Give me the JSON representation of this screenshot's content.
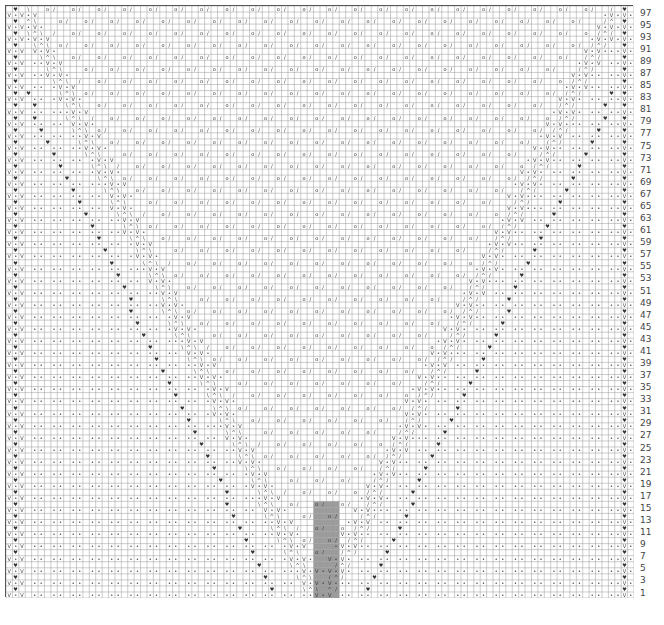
{
  "chart_title": "",
  "chart_type": "knitting-chart",
  "grid": {
    "rows": 98,
    "cols": 98
  },
  "row_labels": [
    "97",
    "95",
    "93",
    "91",
    "89",
    "87",
    "85",
    "83",
    "81",
    "79",
    "77",
    "75",
    "73",
    "71",
    "69",
    "67",
    "65",
    "63",
    "61",
    "59",
    "57",
    "55",
    "53",
    "51",
    "49",
    "47",
    "45",
    "43",
    "41",
    "39",
    "37",
    "35",
    "33",
    "31",
    "29",
    "27",
    "25",
    "23",
    "21",
    "19",
    "17",
    "15",
    "13",
    "11",
    "9",
    "7",
    "5",
    "3",
    "1"
  ],
  "symbols": {
    "slip": "V",
    "purl": "•",
    "slip_wyif": "♥",
    "yarn_over": "o",
    "k2tog": "/",
    "ssk": "\\",
    "double_dec": "^"
  },
  "colors": {
    "grid_line": "#9a9a9a",
    "heavy_line": "#555555",
    "shade": "#9c9c9c",
    "text": "#333333"
  },
  "shaded_region": {
    "rows_from": 1,
    "rows_to": 16,
    "cols_from": 48,
    "cols_to": 51
  }
}
